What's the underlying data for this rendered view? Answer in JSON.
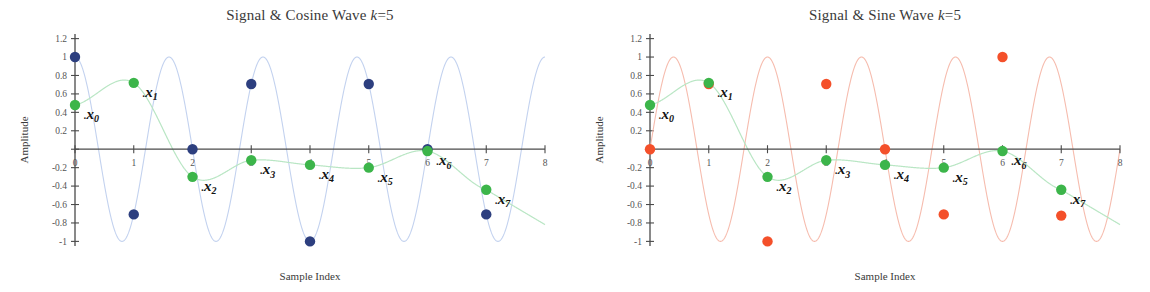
{
  "figure": {
    "panel_count": 2,
    "background": "#ffffff"
  },
  "colors": {
    "signal_green": "#3cb54a",
    "signal_line": "#b9e6c4",
    "cosine_blue": "#2d3f7f",
    "cosine_line": "#c3d2ef",
    "sine_orange": "#f4502a",
    "sine_line": "#f6bcae",
    "axis": "#4a4a4a",
    "text": "#2b2b2b"
  },
  "panels": [
    {
      "id": "cosine-panel",
      "title_main": "Signal & Cosine Wave ",
      "title_var": "k",
      "title_eq": "=5",
      "title_full": "Signal & Cosine Wave k=5",
      "xlabel": "Sample Index",
      "ylabel": "Amplitude",
      "yticks": [
        "1.2",
        "1",
        "0.8",
        "0.6",
        "0.4",
        "0.2",
        "",
        "-0.2",
        "-0.4",
        "-0.6",
        "-0.8",
        "-1"
      ],
      "ytick_values": [
        1.2,
        1.0,
        0.8,
        0.6,
        0.4,
        0.2,
        0,
        -0.2,
        -0.4,
        -0.6,
        -0.8,
        -1.0
      ],
      "xticks": [
        "0",
        "1",
        "2",
        "3",
        "4",
        "5",
        "6",
        "7",
        "8"
      ],
      "xtick_values": [
        0,
        1,
        2,
        3,
        4,
        5,
        6,
        7,
        8
      ],
      "xlim": [
        0,
        8
      ],
      "ylim": [
        -1.05,
        1.25
      ],
      "basis_name": "cosine",
      "basis_k": 5,
      "basis_color": "#2d3f7f",
      "basis_line_color": "#c3d2ef",
      "sample_labels": [
        "x0",
        "x1",
        "x2",
        "x3",
        "x4",
        "x5",
        "x6",
        "x7"
      ],
      "sample_label_display": [
        "x",
        "x",
        "x",
        "x",
        "x",
        "x",
        "x",
        "x"
      ],
      "sample_label_subs": [
        "0",
        "1",
        "2",
        "3",
        "4",
        "5",
        "6",
        "7"
      ]
    },
    {
      "id": "sine-panel",
      "title_main": "Signal & Sine Wave ",
      "title_var": "k",
      "title_eq": "=5",
      "title_full": "Signal & Sine Wave k=5",
      "xlabel": "Sample Index",
      "ylabel": "Amplitude",
      "yticks": [
        "1.2",
        "1",
        "0.8",
        "0.6",
        "0.4",
        "0.2",
        "",
        "-0.2",
        "-0.4",
        "-0.6",
        "-0.8",
        "-1"
      ],
      "ytick_values": [
        1.2,
        1.0,
        0.8,
        0.6,
        0.4,
        0.2,
        0,
        -0.2,
        -0.4,
        -0.6,
        -0.8,
        -1.0
      ],
      "xticks": [
        "0",
        "1",
        "2",
        "3",
        "4",
        "5",
        "6",
        "7",
        "8"
      ],
      "xtick_values": [
        0,
        1,
        2,
        3,
        4,
        5,
        6,
        7,
        8
      ],
      "xlim": [
        0,
        8
      ],
      "ylim": [
        -1.05,
        1.25
      ],
      "basis_name": "sine",
      "basis_k": 5,
      "basis_color": "#f4502a",
      "basis_line_color": "#f6bcae",
      "sample_labels": [
        "x0",
        "x1",
        "x2",
        "x3",
        "x4",
        "x5",
        "x6",
        "x7"
      ],
      "sample_label_display": [
        "x",
        "x",
        "x",
        "x",
        "x",
        "x",
        "x",
        "x"
      ],
      "sample_label_subs": [
        "0",
        "1",
        "2",
        "3",
        "4",
        "5",
        "6",
        "7"
      ]
    }
  ],
  "chart_data": [
    {
      "type": "line",
      "title": "Signal & Cosine Wave k=5",
      "xlabel": "Sample Index",
      "ylabel": "Amplitude",
      "xlim": [
        0,
        8
      ],
      "ylim": [
        -1.05,
        1.25
      ],
      "xticks": [
        0,
        1,
        2,
        3,
        4,
        5,
        6,
        7,
        8
      ],
      "yticks": [
        1.2,
        1.0,
        0.8,
        0.6,
        0.4,
        0.2,
        0,
        -0.2,
        -0.4,
        -0.6,
        -0.8,
        -1.0
      ],
      "grid": false,
      "legend": "none",
      "x": [
        0,
        1,
        2,
        3,
        4,
        5,
        6,
        7
      ],
      "series": [
        {
          "name": "signal samples",
          "marker": "circle",
          "color": "#3cb54a",
          "line_color": "#b9e6c4",
          "values": [
            0.48,
            0.72,
            -0.3,
            -0.12,
            -0.17,
            -0.2,
            -0.02,
            -0.44
          ]
        },
        {
          "name": "cosine basis samples k=5",
          "marker": "circle",
          "color": "#2d3f7f",
          "line_color": "#c3d2ef",
          "values": [
            1.0,
            -0.707,
            0.0,
            0.707,
            -1.0,
            0.707,
            0.0,
            -0.707
          ]
        }
      ],
      "continuous_curves": [
        {
          "name": "signal (continuous)",
          "color": "#b9e6c4",
          "formula": "0.48*cos(2*pi*0.25*x + 0.35) * exp(-0.18*x) + small ripple",
          "note": "smooth decaying oscillation through the green sample dots"
        },
        {
          "name": "cosine wave k=5 (continuous)",
          "color": "#c3d2ef",
          "formula": "cos(2*pi*5*x/8)",
          "amplitude": 1.0,
          "period_in_samples": 1.6
        }
      ],
      "annotations": [
        {
          "label": "x0",
          "x": 0,
          "y": 0.48
        },
        {
          "label": "x1",
          "x": 1,
          "y": 0.72
        },
        {
          "label": "x2",
          "x": 2,
          "y": -0.3
        },
        {
          "label": "x3",
          "x": 3,
          "y": -0.12
        },
        {
          "label": "x4",
          "x": 4,
          "y": -0.17
        },
        {
          "label": "x5",
          "x": 5,
          "y": -0.2
        },
        {
          "label": "x6",
          "x": 6,
          "y": -0.02
        },
        {
          "label": "x7",
          "x": 7,
          "y": -0.44
        }
      ]
    },
    {
      "type": "line",
      "title": "Signal & Sine Wave k=5",
      "xlabel": "Sample Index",
      "ylabel": "Amplitude",
      "xlim": [
        0,
        8
      ],
      "ylim": [
        -1.05,
        1.25
      ],
      "xticks": [
        0,
        1,
        2,
        3,
        4,
        5,
        6,
        7,
        8
      ],
      "yticks": [
        1.2,
        1.0,
        0.8,
        0.6,
        0.4,
        0.2,
        0,
        -0.2,
        -0.4,
        -0.6,
        -0.8,
        -1.0
      ],
      "grid": false,
      "legend": "none",
      "x": [
        0,
        1,
        2,
        3,
        4,
        5,
        6,
        7
      ],
      "series": [
        {
          "name": "signal samples",
          "marker": "circle",
          "color": "#3cb54a",
          "line_color": "#b9e6c4",
          "values": [
            0.48,
            0.72,
            -0.3,
            -0.12,
            -0.17,
            -0.2,
            -0.02,
            -0.44
          ]
        },
        {
          "name": "sine basis samples k=5",
          "marker": "circle",
          "color": "#f4502a",
          "line_color": "#f6bcae",
          "values": [
            0.0,
            0.707,
            -1.0,
            0.707,
            0.0,
            -0.707,
            1.0,
            -0.72
          ]
        }
      ],
      "continuous_curves": [
        {
          "name": "signal (continuous)",
          "color": "#b9e6c4",
          "formula": "0.48*cos(2*pi*0.25*x + 0.35) * exp(-0.18*x) + small ripple",
          "note": "smooth decaying oscillation through the green sample dots"
        },
        {
          "name": "sine wave k=5 (continuous)",
          "color": "#f6bcae",
          "formula": "sin(2*pi*5*x/8)",
          "amplitude": 1.0,
          "period_in_samples": 1.6
        }
      ],
      "annotations": [
        {
          "label": "x0",
          "x": 0,
          "y": 0.48
        },
        {
          "label": "x1",
          "x": 1,
          "y": 0.72
        },
        {
          "label": "x2",
          "x": 2,
          "y": -0.3
        },
        {
          "label": "x3",
          "x": 3,
          "y": -0.12
        },
        {
          "label": "x4",
          "x": 4,
          "y": -0.17
        },
        {
          "label": "x5",
          "x": 5,
          "y": -0.2
        },
        {
          "label": "x6",
          "x": 6,
          "y": -0.02
        },
        {
          "label": "x7",
          "x": 7,
          "y": -0.44
        }
      ]
    }
  ]
}
